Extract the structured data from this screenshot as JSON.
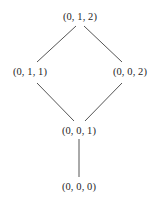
{
  "figure": {
    "kind": "hasse-diagram",
    "background_color": "#ffffff",
    "edge_color": "#555555",
    "text_color": "#262626"
  },
  "nodes": [
    {
      "id": "top",
      "label": "(0, 1, 2)",
      "x": 80,
      "y": 17
    },
    {
      "id": "left",
      "label": "(0, 1, 1)",
      "x": 30,
      "y": 72
    },
    {
      "id": "right",
      "label": "(0, 0, 2)",
      "x": 130,
      "y": 72
    },
    {
      "id": "middle",
      "label": "(0, 0, 1)",
      "x": 79,
      "y": 131
    },
    {
      "id": "bottom",
      "label": "(0, 0, 0)",
      "x": 79,
      "y": 187
    }
  ],
  "edges": [
    {
      "id": "top-left",
      "from": "top",
      "to": "left",
      "x1": 76,
      "y1": 26,
      "x2": 37,
      "y2": 62
    },
    {
      "id": "top-right",
      "from": "top",
      "to": "right",
      "x1": 84,
      "y1": 26,
      "x2": 122,
      "y2": 62
    },
    {
      "id": "left-middle",
      "from": "left",
      "to": "middle",
      "x1": 37,
      "y1": 83,
      "x2": 74,
      "y2": 121
    },
    {
      "id": "right-middle",
      "from": "right",
      "to": "middle",
      "x1": 122,
      "y1": 83,
      "x2": 85,
      "y2": 121
    },
    {
      "id": "middle-bottom",
      "from": "middle",
      "to": "bottom",
      "x1": 79,
      "y1": 139,
      "x2": 79,
      "y2": 177
    }
  ]
}
